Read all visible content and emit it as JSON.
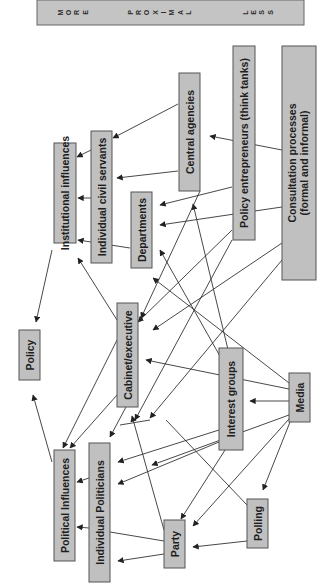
{
  "header": {
    "left_label": "MORE",
    "center_label": "PROXIMAL",
    "right_label": "LESS",
    "left_letters": [
      "M",
      "O",
      "R",
      "E"
    ],
    "center_letters": [
      "P",
      "R",
      "O",
      "X",
      "I",
      "M",
      "A",
      "L"
    ],
    "right_letters": [
      "L",
      "E",
      "S",
      "S"
    ]
  },
  "nodes": {
    "policy": "Policy",
    "institutional_influences": "Institutional influences",
    "individual_civil_servants": "Individual civil servants",
    "departments": "Departments",
    "central_agencies": "Central agencies",
    "policy_entrepreneurs": "Policy entrepreneurs (think tanks)",
    "consultation_line1": "Consultation processes",
    "consultation_line2": "(formal and informal)",
    "cabinet_executive": "Cabinet/executive",
    "interest_groups": "Interest groups",
    "media": "Media",
    "political_influences": "Political Influences",
    "individual_politicians": "Individual Politicians",
    "party": "Party",
    "polling": "Polling"
  },
  "colors": {
    "box_fill": "#c0c0c0",
    "box_stroke": "#555555",
    "edge": "#333333",
    "text": "#1e1e1e"
  },
  "edges": [
    {
      "from": "Institutional influences",
      "to": "Policy"
    },
    {
      "from": "Political Influences",
      "to": "Policy"
    },
    {
      "from": "Individual civil servants",
      "to": "Institutional influences"
    },
    {
      "from": "Departments",
      "to": "Institutional influences"
    },
    {
      "from": "Cabinet/executive",
      "to": "Institutional influences"
    },
    {
      "from": "Central agencies",
      "to": "Individual civil servants"
    },
    {
      "from": "Central agencies",
      "to": "Departments"
    },
    {
      "from": "Policy entrepreneurs (think tanks)",
      "to": "Departments"
    },
    {
      "from": "Consultation processes",
      "to": "Central agencies"
    },
    {
      "from": "Consultation processes",
      "to": "Departments"
    },
    {
      "from": "Interest groups",
      "to": "Central agencies"
    },
    {
      "from": "Interest groups",
      "to": "Departments"
    },
    {
      "from": "Media",
      "to": "Departments"
    },
    {
      "from": "Policy entrepreneurs (think tanks)",
      "to": "Cabinet/executive"
    },
    {
      "from": "Consultation processes",
      "to": "Cabinet/executive"
    },
    {
      "from": "Media",
      "to": "Cabinet/executive"
    },
    {
      "from": "Media",
      "to": "Interest groups"
    },
    {
      "from": "Cabinet/executive",
      "to": "Political Influences"
    },
    {
      "from": "Individual Politicians",
      "to": "Political Influences"
    },
    {
      "from": "Party",
      "to": "Political Influences"
    },
    {
      "from": "Interest groups",
      "to": "Individual Politicians"
    },
    {
      "from": "Media",
      "to": "Individual Politicians"
    },
    {
      "from": "Party",
      "to": "Individual Politicians"
    },
    {
      "from": "Party",
      "to": "Cabinet/executive"
    },
    {
      "from": "Interest groups",
      "to": "Party"
    },
    {
      "from": "Media",
      "to": "Party"
    },
    {
      "from": "Media",
      "to": "Polling"
    },
    {
      "from": "Polling",
      "to": "Party"
    }
  ]
}
